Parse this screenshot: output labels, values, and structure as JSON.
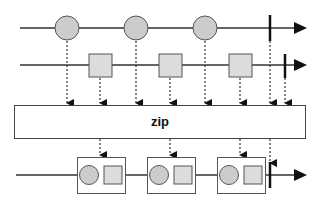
{
  "diagram": {
    "operator_label": "zip",
    "colors": {
      "line": "#333333",
      "item_fill": "#cccccc",
      "square_fill": "#dcdcdc",
      "box_stroke": "#555555",
      "background": "#ffffff"
    },
    "input_streams": [
      {
        "name": "circles",
        "items": [
          "circle",
          "circle",
          "circle"
        ],
        "completes": true
      },
      {
        "name": "squares",
        "items": [
          "square",
          "square",
          "square"
        ],
        "completes": true
      }
    ],
    "output_stream": {
      "items": [
        "circle+square",
        "circle+square",
        "circle+square"
      ],
      "completes": true
    }
  }
}
